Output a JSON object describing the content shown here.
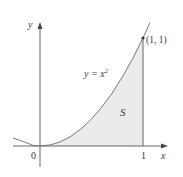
{
  "figure": {
    "axes": {
      "x_label": "x",
      "y_label": "y",
      "origin_label": "0",
      "x_tick_label": "1"
    },
    "curve": {
      "label_prefix": "y = x",
      "label_exponent": "2",
      "function": "x^2"
    },
    "point": {
      "label": "(1, 1)",
      "x": 1,
      "y": 1
    },
    "region": {
      "label": "S",
      "description": "area under y = x^2 from x = 0 to x = 1"
    },
    "colors": {
      "axis": "#555555",
      "curve": "#777777",
      "fill": "#ebebeb",
      "text": "#3a3a3a"
    }
  }
}
